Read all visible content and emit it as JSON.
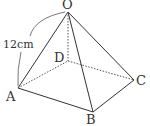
{
  "diagram": {
    "type": "square-pyramid",
    "vertices": {
      "O": {
        "label": "O",
        "x": 68,
        "y": 12
      },
      "A": {
        "label": "A",
        "x": 18,
        "y": 88
      },
      "B": {
        "label": "B",
        "x": 93,
        "y": 112
      },
      "C": {
        "label": "C",
        "x": 134,
        "y": 80
      },
      "D": {
        "label": "D",
        "x": 68,
        "y": 61
      }
    },
    "visible_edges": [
      "OA",
      "OB",
      "OC",
      "AB",
      "BC"
    ],
    "hidden_edges": [
      "OD",
      "AD",
      "DC"
    ],
    "measurement": {
      "edge": "OA",
      "label": "12cm"
    },
    "colors": {
      "line": "#333333",
      "background": "#ffffff"
    }
  }
}
